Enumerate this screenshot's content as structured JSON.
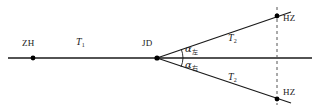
{
  "figure": {
    "kind": "route-alignment-diagram",
    "colors": {
      "line": "#1a1a1a",
      "dashed": "#555555",
      "point": "#000000",
      "background": "#ffffff"
    }
  },
  "labels": {
    "zh": "ZH",
    "jd": "JD",
    "tangent_main": "T",
    "tangent_main_sub": "1",
    "tangent_branch_upper": "T",
    "tangent_branch_upper_sub": "2",
    "tangent_branch_lower": "T",
    "tangent_branch_lower_sub": "2",
    "alpha_upper": "α",
    "alpha_upper_sub": "左",
    "alpha_lower": "α",
    "alpha_lower_sub": "右",
    "hz_upper": "HZ",
    "hz_lower": "HZ"
  },
  "geometry": {
    "axis": {
      "x1": 8,
      "y1": 58,
      "x2": 312,
      "y2": 58
    },
    "vertex": {
      "x": 157,
      "y": 58,
      "name": "JD"
    },
    "point_zh": {
      "x": 33,
      "y": 58
    },
    "point_hz_upper": {
      "x": 277,
      "y": 16
    },
    "point_hz_lower": {
      "x": 277,
      "y": 99
    },
    "branch_upper_end": {
      "x": 291,
      "y": 12
    },
    "branch_lower_end": {
      "x": 291,
      "y": 103
    },
    "dashed_line": {
      "x": 277,
      "y1": 8,
      "y2": 104
    },
    "angle_arc_upper_radius": 26,
    "angle_arc_lower_radius": 26
  }
}
